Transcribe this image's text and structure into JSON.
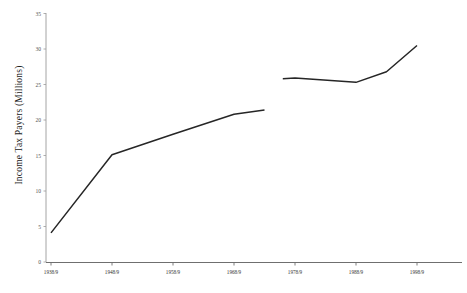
{
  "chart_data": {
    "type": "line",
    "title": "",
    "xlabel": "",
    "ylabel": "Income Tax Payers (Millions)",
    "ylim": [
      0,
      35
    ],
    "ytick_labels": [
      "0",
      "5",
      "10",
      "15",
      "20",
      "25",
      "30",
      "35"
    ],
    "ytick_values": [
      0,
      5,
      10,
      15,
      20,
      25,
      30,
      35
    ],
    "categories": [
      "1938/9",
      "1948/9",
      "1958/9",
      "1968/9",
      "1978/9",
      "1988/9",
      "1998/9"
    ],
    "grid": false,
    "legend": "none",
    "series": [
      {
        "name": "Income Tax Payers (Millions)",
        "segment": "pre-break",
        "x": [
          "1938/9",
          "1948/9",
          "1958/9",
          "1968/9",
          "1973/4"
        ],
        "values": [
          4.1,
          15.1,
          18.0,
          20.8,
          21.4
        ]
      },
      {
        "name": "Income Tax Payers (Millions)",
        "segment": "post-break",
        "x": [
          "1976/7",
          "1978/9",
          "1988/9",
          "1993/4",
          "1998/9"
        ],
        "values": [
          25.8,
          25.9,
          25.3,
          26.8,
          30.5
        ]
      }
    ],
    "annotations": [
      "Series is discontinuous: a break in the line occurs between the 1968/9-1978/9 interval."
    ]
  },
  "axis": {
    "y_title": "Income Tax Payers (Millions)"
  }
}
